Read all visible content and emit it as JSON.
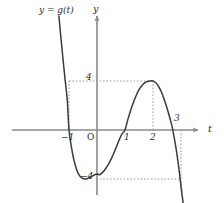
{
  "figure": {
    "background_color": "#ffffff",
    "curve_color": "#3a3a3a",
    "axis_color": "#8a8a8a",
    "dash_color": "#9a9a9a",
    "text_color": "#2b2b2b"
  },
  "labels": {
    "curve_label": "y = g(t)",
    "y_axis_label": "y",
    "x_axis_label": "t",
    "origin_label": "O",
    "tick_neg_one": "−1",
    "tick_one": "1",
    "tick_two": "2",
    "tick_three": "3",
    "tick_four": "4",
    "tick_neg_four": "−4"
  },
  "chart_data": {
    "type": "line",
    "title": "",
    "xlabel": "t",
    "ylabel": "y",
    "curve_label": "y = g(t)",
    "grid": false,
    "legend": "none",
    "xlim": [
      -1.65,
      3.35
    ],
    "ylim": [
      -6.6,
      9.5
    ],
    "x_ticks": [
      -1,
      1,
      2,
      3
    ],
    "x_tick_labels": [
      "−1",
      "1",
      "2",
      "3"
    ],
    "y_ticks": [
      -4,
      4
    ],
    "y_tick_labels": [
      "−4",
      "4"
    ],
    "origin_label": "O",
    "annotations": [
      {
        "text": "y = g(t)",
        "x": -1.25,
        "y": 8.6
      },
      {
        "text": "y",
        "x": 0.12,
        "y": 9.1
      },
      {
        "text": "t",
        "x": 3.28,
        "y": 0.55
      }
    ],
    "dashed_guides": [
      {
        "orientation": "horizontal",
        "value": 4,
        "from_x": -1.0,
        "to_x": 2.0
      },
      {
        "orientation": "horizontal",
        "value": -4,
        "from_x": 0.1,
        "to_x": 2.95
      },
      {
        "orientation": "vertical",
        "value": -1.0,
        "from_y": 0,
        "to_y": 4
      },
      {
        "orientation": "vertical",
        "value": 2.0,
        "from_y": 0,
        "to_y": 4
      },
      {
        "orientation": "vertical",
        "value": 3.0,
        "from_y": 0,
        "to_y": -4.8
      }
    ],
    "key_points": [
      {
        "label": "x-intercept",
        "x": -1.0,
        "y": 0
      },
      {
        "label": "local-minimum",
        "x": 0.1,
        "y": -4
      },
      {
        "label": "x-intercept",
        "x": 1.0,
        "y": 0
      },
      {
        "label": "local-maximum",
        "x": 2.0,
        "y": 4
      },
      {
        "label": "x-intercept",
        "x": 2.85,
        "y": 0
      }
    ],
    "x": [
      -1.36,
      -1.3,
      -1.24,
      -1.18,
      -1.12,
      -1.06,
      -1.0,
      -0.92,
      -0.84,
      -0.76,
      -0.68,
      -0.6,
      -0.52,
      -0.44,
      -0.36,
      -0.28,
      -0.2,
      -0.12,
      -0.04,
      0.04,
      0.1,
      0.18,
      0.26,
      0.34,
      0.42,
      0.5,
      0.58,
      0.66,
      0.74,
      0.82,
      0.9,
      1.0,
      1.1,
      1.2,
      1.3,
      1.4,
      1.5,
      1.6,
      1.7,
      1.8,
      1.9,
      2.0,
      2.1,
      2.2,
      2.3,
      2.4,
      2.5,
      2.6,
      2.7,
      2.8,
      2.85,
      2.9,
      2.95,
      3.0,
      3.05,
      3.1
    ],
    "y": [
      9.3,
      7.8,
      6.4,
      5.0,
      3.7,
      2.4,
      0.0,
      -1.3,
      -2.3,
      -3.0,
      -3.5,
      -3.8,
      -3.95,
      -4.0,
      -3.98,
      -3.9,
      -3.8,
      -3.7,
      -3.62,
      -3.62,
      -3.64,
      -3.5,
      -3.3,
      -3.05,
      -2.75,
      -2.4,
      -2.0,
      -1.55,
      -1.1,
      -0.65,
      -0.3,
      0.0,
      0.85,
      1.6,
      2.25,
      2.82,
      3.3,
      3.62,
      3.85,
      3.96,
      4.0,
      4.0,
      3.85,
      3.55,
      3.1,
      2.5,
      1.8,
      1.0,
      0.1,
      -1.2,
      -1.9,
      -2.7,
      -3.6,
      -4.6,
      -5.5,
      -6.4
    ]
  }
}
